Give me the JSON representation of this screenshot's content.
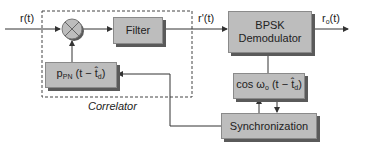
{
  "diagram": {
    "input_label": "r(t)",
    "intermediate_label": "r'(t)",
    "output_label_main": "r",
    "output_label_sub": "o",
    "output_label_tail": "(t)",
    "correlator_label": "Correlator",
    "blocks": {
      "filter": "Filter",
      "bpsk_line1": "BPSK",
      "bpsk_line2": "Demodulator",
      "pn_main": "p",
      "pn_sub": "PN",
      "pn_tail": " (t − t̂",
      "pn_sub2": "d",
      "pn_close": ")",
      "cos_main": "cos ω",
      "cos_sub": "o",
      "cos_tail": " (t − t̂",
      "cos_sub2": "d",
      "cos_close": ")",
      "sync": "Synchronization"
    },
    "colors": {
      "block_fill": "#bdbdbd",
      "block_shadow": "#5a5a5a",
      "line": "#333333"
    }
  }
}
